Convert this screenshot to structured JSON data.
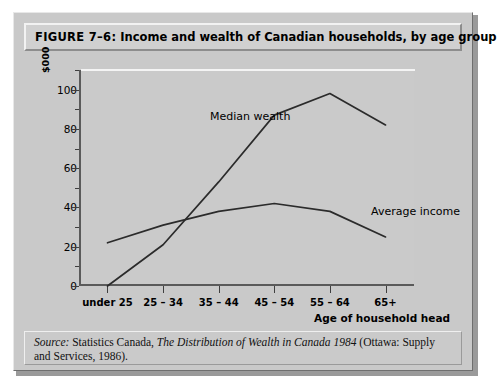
{
  "figure": {
    "number_label": "FIGURE 7–6:",
    "title": "Income and wealth of Canadian households, by age group",
    "source_prefix": "Source:",
    "source_part1": " Statistics Canada, ",
    "source_italic": "The Distribution of Wealth in Canada 1984",
    "source_part2": " (Ottawa: Supply and Services, 1986)."
  },
  "chart_data": {
    "type": "line",
    "title": "Income and wealth of Canadian households, by age group",
    "xlabel": "Age of household head",
    "ylabel": "$000",
    "categories": [
      "under 25",
      "25 – 34",
      "35 – 44",
      "45 – 54",
      "55 – 64",
      "65+"
    ],
    "ylim": [
      0,
      110
    ],
    "y_ticks": [
      0,
      20,
      40,
      60,
      80,
      100
    ],
    "y_tick_labels": [
      "0",
      "20",
      "40",
      "60",
      "80",
      "100"
    ],
    "y_minor_ticks": [
      10,
      30,
      50,
      70,
      90,
      110
    ],
    "grid": false,
    "legend_position": "inline-annotation",
    "series": [
      {
        "name": "Median wealth",
        "values": [
          0,
          21,
          53,
          87,
          98,
          82
        ],
        "color": "#2b2b2b"
      },
      {
        "name": "Average income",
        "values": [
          22,
          31,
          38,
          42,
          38,
          25
        ],
        "color": "#2b2b2b"
      }
    ],
    "annotations": [
      {
        "text": "Median wealth"
      },
      {
        "text": "Average income"
      }
    ]
  },
  "colors": {
    "figure_background": "#c9c9c9",
    "plot_background": "#cacaca",
    "line": "#2b2b2b",
    "axis": "#5a5a5a",
    "page": "#ffffff"
  }
}
